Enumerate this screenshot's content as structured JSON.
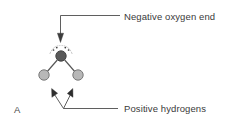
{
  "figure": {
    "panel_letter": "A",
    "background_color": "#ffffff",
    "callouts": [
      {
        "id": "negative-oxygen-end",
        "text": "Negative oxygen end",
        "points_to": "oxygen-atom",
        "arrow_color": "#4d4d4d"
      },
      {
        "id": "positive-hydrogens",
        "text": "Positive hydrogens",
        "points_to": "hydrogen-atoms",
        "arrow_color": "#4d4d4d"
      }
    ],
    "molecule": {
      "name": "water-molecule",
      "atoms": [
        {
          "id": "oxygen-atom",
          "symbol": "O",
          "cx": 61,
          "cy": 56,
          "r": 5.2,
          "fill": "#595959",
          "stroke": "#3d3d3d"
        },
        {
          "id": "hydrogen-atom-left",
          "symbol": "H",
          "cx": 44,
          "cy": 75,
          "r": 5.2,
          "fill": "#b8b8b8",
          "stroke": "#6e6e6e"
        },
        {
          "id": "hydrogen-atom-right",
          "symbol": "H",
          "cx": 78,
          "cy": 75,
          "r": 5.2,
          "fill": "#b8b8b8",
          "stroke": "#6e6e6e"
        }
      ],
      "bonds": [
        {
          "id": "bond-o-h-left",
          "from": "oxygen-atom",
          "to": "hydrogen-atom-left",
          "color": "#555555"
        },
        {
          "id": "bond-o-h-right",
          "from": "oxygen-atom",
          "to": "hydrogen-atom-right",
          "color": "#555555"
        }
      ],
      "lone_pairs": [
        {
          "id": "lone-pair-left",
          "dots": [
            [
              53.5,
              49.5
            ],
            [
              57.0,
              47.5
            ]
          ],
          "color": "#3d3d3d"
        },
        {
          "id": "lone-pair-right",
          "dots": [
            [
              65.0,
              47.5
            ],
            [
              68.5,
              49.5
            ]
          ],
          "color": "#3d3d3d"
        }
      ],
      "electron-cloud-arcs": [
        {
          "id": "cloud-arc-left",
          "color": "#9a9a9a"
        },
        {
          "id": "cloud-arc-right",
          "color": "#9a9a9a"
        }
      ]
    }
  }
}
